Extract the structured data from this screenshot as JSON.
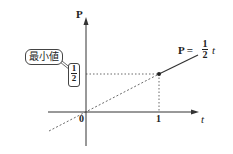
{
  "diagram": {
    "axes": {
      "y_label": "P",
      "x_label": "t",
      "origin_label": "0",
      "x_tick_label": "1"
    },
    "y_marker": {
      "numerator": "1",
      "denominator": "2"
    },
    "callout": {
      "text": "最小値"
    },
    "line_label": {
      "prefix": "P =",
      "numerator": "1",
      "denominator": "2",
      "variable": "t"
    },
    "point": {
      "t": 1,
      "P": 0.5
    }
  }
}
